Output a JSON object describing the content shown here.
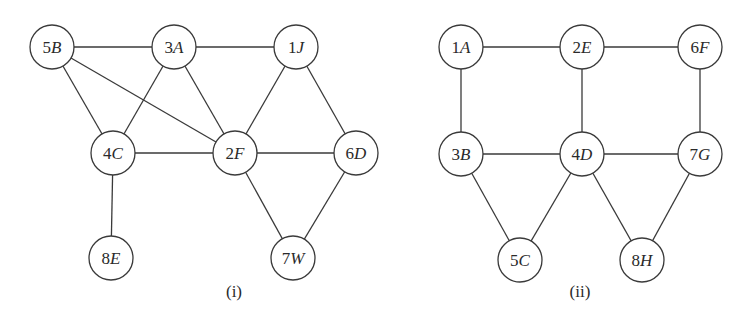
{
  "node_radius": 22,
  "colors": {
    "stroke": "#3a3a3a",
    "text": "#2a2a2a",
    "background": "#ffffff"
  },
  "graphs": [
    {
      "caption": "(i)",
      "caption_pos": [
        234,
        297
      ],
      "nodes": [
        {
          "id": "5B",
          "num": "5",
          "letter": "B",
          "x": 52,
          "y": 47
        },
        {
          "id": "3A",
          "num": "3",
          "letter": "A",
          "x": 174,
          "y": 47
        },
        {
          "id": "1J",
          "num": "1",
          "letter": "J",
          "x": 296,
          "y": 47
        },
        {
          "id": "4C",
          "num": "4",
          "letter": "C",
          "x": 113,
          "y": 153
        },
        {
          "id": "2F",
          "num": "2",
          "letter": "F",
          "x": 235,
          "y": 153
        },
        {
          "id": "6D",
          "num": "6",
          "letter": "D",
          "x": 356,
          "y": 153
        },
        {
          "id": "8E",
          "num": "8",
          "letter": "E",
          "x": 111,
          "y": 258
        },
        {
          "id": "7W",
          "num": "7",
          "letter": "W",
          "x": 293,
          "y": 258
        }
      ],
      "edges": [
        [
          "5B",
          "3A"
        ],
        [
          "3A",
          "1J"
        ],
        [
          "5B",
          "4C"
        ],
        [
          "5B",
          "2F"
        ],
        [
          "3A",
          "4C"
        ],
        [
          "3A",
          "2F"
        ],
        [
          "1J",
          "2F"
        ],
        [
          "1J",
          "6D"
        ],
        [
          "4C",
          "2F"
        ],
        [
          "2F",
          "6D"
        ],
        [
          "4C",
          "8E"
        ],
        [
          "2F",
          "7W"
        ],
        [
          "6D",
          "7W"
        ]
      ]
    },
    {
      "caption": "(ii)",
      "caption_pos": [
        580,
        297
      ],
      "nodes": [
        {
          "id": "1A",
          "num": "1",
          "letter": "A",
          "x": 461,
          "y": 47
        },
        {
          "id": "2E",
          "num": "2",
          "letter": "E",
          "x": 582,
          "y": 47
        },
        {
          "id": "6F",
          "num": "6",
          "letter": "F",
          "x": 700,
          "y": 47
        },
        {
          "id": "3B",
          "num": "3",
          "letter": "B",
          "x": 461,
          "y": 154
        },
        {
          "id": "4D",
          "num": "4",
          "letter": "D",
          "x": 582,
          "y": 154
        },
        {
          "id": "7G",
          "num": "7",
          "letter": "G",
          "x": 700,
          "y": 154
        },
        {
          "id": "5C",
          "num": "5",
          "letter": "C",
          "x": 520,
          "y": 260
        },
        {
          "id": "8H",
          "num": "8",
          "letter": "H",
          "x": 642,
          "y": 260
        }
      ],
      "edges": [
        [
          "1A",
          "2E"
        ],
        [
          "2E",
          "6F"
        ],
        [
          "1A",
          "3B"
        ],
        [
          "2E",
          "4D"
        ],
        [
          "6F",
          "7G"
        ],
        [
          "3B",
          "4D"
        ],
        [
          "4D",
          "7G"
        ],
        [
          "3B",
          "5C"
        ],
        [
          "4D",
          "5C"
        ],
        [
          "4D",
          "8H"
        ],
        [
          "7G",
          "8H"
        ]
      ]
    }
  ]
}
